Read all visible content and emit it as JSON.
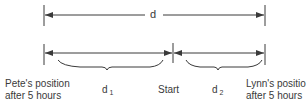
{
  "diagram": {
    "total_distance_label": "d",
    "segments": [
      {
        "label_base": "d",
        "label_sub": "1",
        "direction": "left",
        "from": "Start",
        "to": "Pete's position after 5 hours"
      },
      {
        "label_base": "d",
        "label_sub": "2",
        "direction": "right",
        "from": "Start",
        "to": "Lynn's position after 5 hours"
      }
    ],
    "points": {
      "left": {
        "line1": "Pete's position",
        "line2": "after 5 hours"
      },
      "center": {
        "label": "Start"
      },
      "right": {
        "line1": "Lynn's position",
        "line2": "after 5 hours"
      }
    },
    "colors": {
      "line": "#3a3a3a",
      "background": "#ffffff"
    }
  }
}
